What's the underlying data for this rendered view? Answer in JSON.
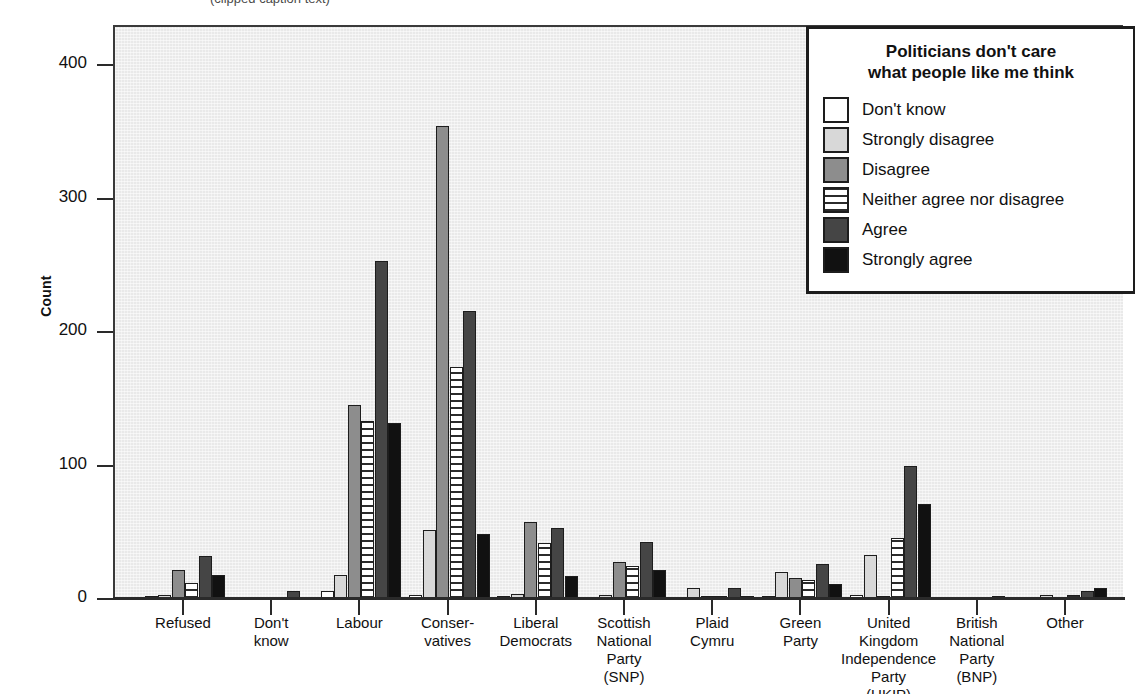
{
  "top_caption": "(clipped caption text)",
  "axis": {
    "ylabel": "Count",
    "yticks": [
      "0",
      "100",
      "200",
      "300",
      "400"
    ]
  },
  "legend": {
    "title": "Politicians don't care\nwhat people like me think",
    "items": [
      {
        "label": "Don't know",
        "swatch": "sw-dontknow",
        "color": "#ffffff"
      },
      {
        "label": "Strongly disagree",
        "swatch": "sw-sdisagree",
        "color": "#d8d8d8"
      },
      {
        "label": "Disagree",
        "swatch": "sw-disagree",
        "color": "#8d8d8d"
      },
      {
        "label": "Neither agree nor disagree",
        "swatch": "sw-neither",
        "color": "#ffffff"
      },
      {
        "label": "Agree",
        "swatch": "sw-agree",
        "color": "#454545"
      },
      {
        "label": "Strongly agree",
        "swatch": "sw-sagree",
        "color": "#111111"
      }
    ]
  },
  "chart_data": {
    "type": "bar",
    "title": "",
    "xlabel": "",
    "ylabel": "Count",
    "ylim": [
      0,
      430
    ],
    "yticks": [
      0,
      100,
      200,
      300,
      400
    ],
    "grid": false,
    "legend_position": "top-right",
    "categories": [
      "Refused",
      "Don't\nknow",
      "Labour",
      "Conser-\nvatives",
      "Liberal\nDemocrats",
      "Scottish\nNational\nParty\n(SNP)",
      "Plaid\nCymru",
      "Green\nParty",
      "United\nKingdom\nIndependence\nParty\n(UKIP)",
      "British\nNational\nParty\n(BNP)",
      "Other"
    ],
    "series": [
      {
        "name": "Don't know",
        "values": [
          2,
          0,
          6,
          3,
          2,
          1,
          1,
          2,
          3,
          1,
          1
        ]
      },
      {
        "name": "Strongly disagree",
        "values": [
          3,
          1,
          18,
          52,
          4,
          3,
          8,
          20,
          33,
          1,
          3
        ]
      },
      {
        "name": "Disagree",
        "values": [
          22,
          1,
          145,
          354,
          58,
          28,
          2,
          16,
          2,
          1,
          1
        ]
      },
      {
        "name": "Neither agree nor disagree",
        "values": [
          12,
          1,
          133,
          174,
          42,
          25,
          2,
          14,
          46,
          1,
          3
        ]
      },
      {
        "name": "Agree",
        "values": [
          32,
          6,
          253,
          216,
          53,
          43,
          8,
          26,
          100,
          2,
          6
        ]
      },
      {
        "name": "Strongly agree",
        "values": [
          18,
          1,
          132,
          49,
          17,
          22,
          2,
          11,
          71,
          1,
          8
        ]
      }
    ]
  }
}
